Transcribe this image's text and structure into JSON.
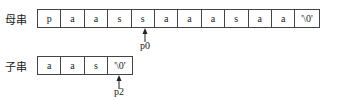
{
  "main_string": {
    "label": "母串",
    "cells": [
      "p",
      "a",
      "a",
      "s",
      "s",
      "a",
      "a",
      "a",
      "s",
      "a",
      "a",
      "'\\0'"
    ]
  },
  "sub_string": {
    "label": "子串",
    "cells": [
      "a",
      "a",
      "s",
      "'\\0'"
    ]
  },
  "pointers": {
    "main": {
      "label": "p0",
      "index": 4
    },
    "sub": {
      "label": "p2",
      "index": 3
    }
  }
}
